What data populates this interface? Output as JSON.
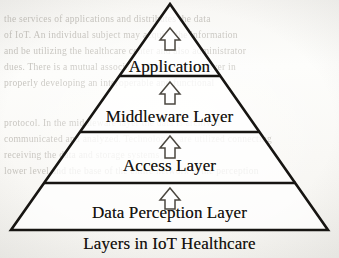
{
  "figure": {
    "caption": "Layers in IoT Healthcare",
    "bands": [
      {
        "id": "application",
        "label": "Application"
      },
      {
        "id": "middleware",
        "label": "Middleware Layer"
      },
      {
        "id": "access",
        "label": "Access Layer"
      },
      {
        "id": "data_perception",
        "label": "Data Perception Layer"
      }
    ],
    "arrows": [
      {
        "id": "arrow-to-application",
        "icon": "up-arrow-icon"
      },
      {
        "id": "arrow-to-middleware",
        "icon": "up-arrow-icon"
      },
      {
        "id": "arrow-to-access",
        "icon": "up-arrow-icon"
      }
    ]
  },
  "geometry": {
    "apex_x": 170,
    "apex_y": 4,
    "base_left_x": 11,
    "base_right_x": 328,
    "base_y": 230,
    "divider_y": [
      76,
      132,
      183
    ]
  },
  "colors": {
    "ink": "#15130f",
    "paper": "#fbfbf9",
    "bleed_text": "#9a968e",
    "stroke": "#171512"
  },
  "bleed_through": {
    "lines": [
      "the services of applications and distributes the data",
      "of IoT. An individual subject may acquire the information",
      "and be utilizing the healthcare center and also administrator",
      "dues. There is a mutual association between each layer in",
      "properly developing an interoperable and functional",
      "",
      "protocol. In the middleware layer the data is archived",
      "communicated and analyzed. Technologies are utilized connecting",
      "receiving the data and storage systems",
      "lower level and the base of the entire network is the perception"
    ]
  }
}
